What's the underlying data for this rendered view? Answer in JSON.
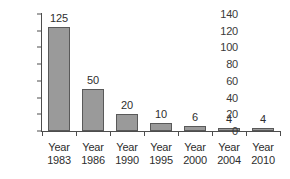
{
  "chart_data": {
    "type": "bar",
    "title": "",
    "subtitle": "",
    "xlabel": "",
    "ylabel": "",
    "categories": [
      "Year 1983",
      "Year 1986",
      "Year 1990",
      "Year 1995",
      "Year 2000",
      "Year 2004",
      "Year 2010"
    ],
    "category_lines": [
      [
        "Year",
        "1983"
      ],
      [
        "Year",
        "1986"
      ],
      [
        "Year",
        "1990"
      ],
      [
        "Year",
        "1995"
      ],
      [
        "Year",
        "2000"
      ],
      [
        "Year",
        "2004"
      ],
      [
        "Year",
        "2010"
      ]
    ],
    "values": [
      125,
      50,
      20,
      10,
      6,
      4,
      4
    ],
    "value_labels": [
      "125",
      "50",
      "20",
      "10",
      "6",
      "4",
      "4"
    ],
    "ylim": [
      0,
      140
    ],
    "yticks": [
      0,
      20,
      40,
      60,
      80,
      100,
      120,
      140
    ],
    "ytick_labels": [
      "0",
      "20",
      "40",
      "60",
      "80",
      "100",
      "120",
      "140"
    ],
    "grid": false,
    "legend": null,
    "legend_position": "none",
    "bar_color": "#9a9a9a",
    "bar_border_color": "#595959",
    "axis_color": "#4d4d4d",
    "text_color": "#2e2e2e",
    "background": "#ffffff"
  }
}
